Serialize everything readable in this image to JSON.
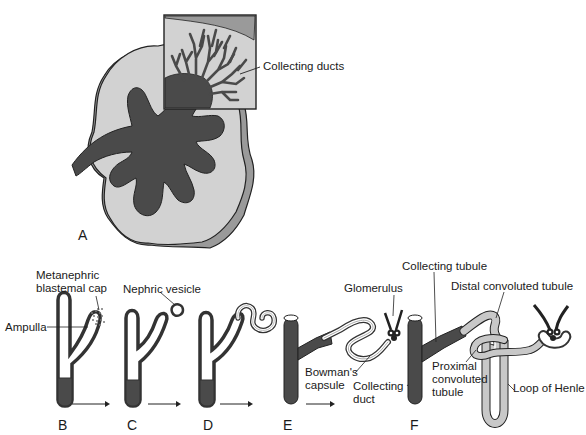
{
  "figure": {
    "panels": {
      "A": "A",
      "B": "B",
      "C": "C",
      "D": "D",
      "E": "E",
      "F": "F"
    },
    "labels": {
      "collecting_ducts": "Collecting ducts",
      "metanephric_line1": "Metanephric",
      "metanephric_line2": "blastemal cap",
      "ampulla": "Ampulla",
      "nephric_vesicle": "Nephric vesicle",
      "glomerulus": "Glomerulus",
      "bowmans_line1": "Bowman's",
      "bowmans_line2": "capsule",
      "collecting_duct_line1": "Collecting",
      "collecting_duct_line2": "duct",
      "collecting_tubule": "Collecting tubule",
      "distal_convoluted_tubule": "Distal convoluted tubule",
      "proximal_line1": "Proximal",
      "proximal_line2": "convoluted",
      "proximal_line3": "tubule",
      "loop_of_henle": "Loop of Henle"
    },
    "colors": {
      "dark": "#4a4a4a",
      "light": "#cfcfcf",
      "mid": "#9a9a9a",
      "outline": "#222222",
      "white": "#ffffff"
    }
  }
}
